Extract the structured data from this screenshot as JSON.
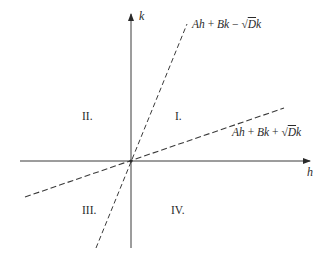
{
  "figure": {
    "axes": {
      "horizontal_label": "h",
      "vertical_label": "k"
    },
    "lines": [
      {
        "name": "steep-line",
        "style": "dashed",
        "label": {
          "parts": [
            "Ah",
            " + ",
            "Bk",
            " − √",
            "D",
            "k"
          ],
          "text": "Ah + Bk − √Dk"
        }
      },
      {
        "name": "shallow-line",
        "style": "dashed",
        "label": {
          "parts": [
            "Ah",
            " + ",
            "Bk",
            " + √",
            "D",
            "k"
          ],
          "text": "Ah + Bk + √Dk"
        }
      }
    ],
    "regions": {
      "q1": "I.",
      "q2": "II.",
      "q3": "III.",
      "q4": "IV."
    },
    "colors": {
      "ink": "#2a2a2a",
      "background": "#ffffff"
    }
  }
}
